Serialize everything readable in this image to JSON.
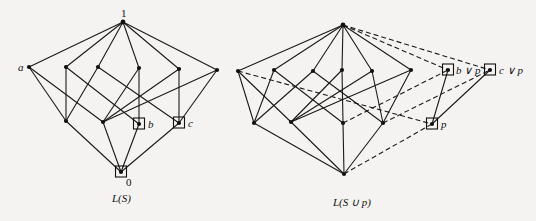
{
  "figure": {
    "left_diagram": {
      "caption": "L(S)",
      "nodes": [
        {
          "id": "top",
          "x": 123,
          "y": 22,
          "label": "1",
          "label_dx": -2,
          "label_dy": -5,
          "boxed": false
        },
        {
          "id": "a",
          "x": 29,
          "y": 67,
          "label": "a",
          "label_dx": -11,
          "label_dy": 4,
          "boxed": false
        },
        {
          "id": "m1",
          "x": 66,
          "y": 67,
          "label": "",
          "boxed": false
        },
        {
          "id": "m2",
          "x": 98,
          "y": 67,
          "label": "",
          "boxed": false
        },
        {
          "id": "m3",
          "x": 139,
          "y": 68,
          "label": "",
          "boxed": false
        },
        {
          "id": "m4",
          "x": 179,
          "y": 69,
          "label": "",
          "boxed": false
        },
        {
          "id": "m5",
          "x": 217,
          "y": 70,
          "label": "",
          "boxed": false
        },
        {
          "id": "l1",
          "x": 66,
          "y": 121,
          "label": "",
          "boxed": false
        },
        {
          "id": "l2",
          "x": 103,
          "y": 122,
          "label": "",
          "boxed": false
        },
        {
          "id": "b",
          "x": 139,
          "y": 124,
          "label": "b",
          "label_dx": 9,
          "label_dy": 4,
          "boxed": true
        },
        {
          "id": "c",
          "x": 179,
          "y": 123,
          "label": "c",
          "label_dx": 9,
          "label_dy": 4,
          "boxed": true
        },
        {
          "id": "bottom",
          "x": 121,
          "y": 172,
          "label": "0",
          "label_dx": 5,
          "label_dy": 14,
          "boxed": true
        }
      ],
      "edges": [
        [
          "top",
          "a",
          false
        ],
        [
          "top",
          "m1",
          false
        ],
        [
          "top",
          "m2",
          false
        ],
        [
          "top",
          "m3",
          false
        ],
        [
          "top",
          "m4",
          false
        ],
        [
          "top",
          "m5",
          false
        ],
        [
          "a",
          "l1",
          false
        ],
        [
          "a",
          "l2",
          false
        ],
        [
          "m1",
          "l1",
          false
        ],
        [
          "m1",
          "b",
          false
        ],
        [
          "m2",
          "l1",
          false
        ],
        [
          "m2",
          "c",
          false
        ],
        [
          "m3",
          "b",
          false
        ],
        [
          "m3",
          "l2",
          false
        ],
        [
          "m4",
          "c",
          false
        ],
        [
          "m4",
          "l2",
          false
        ],
        [
          "m5",
          "l2",
          false
        ],
        [
          "m5",
          "c",
          false
        ],
        [
          "l1",
          "bottom",
          false
        ],
        [
          "l2",
          "bottom",
          false
        ],
        [
          "b",
          "bottom",
          false
        ],
        [
          "c",
          "bottom",
          false
        ]
      ],
      "caption_x": 112,
      "caption_y": 202
    },
    "right_diagram": {
      "caption": "L(S ∪ p)",
      "nodes": [
        {
          "id": "top",
          "x": 343,
          "y": 25,
          "label": "",
          "boxed": false
        },
        {
          "id": "a",
          "x": 238,
          "y": 71,
          "label": "",
          "boxed": false
        },
        {
          "id": "m1",
          "x": 274,
          "y": 70,
          "label": "",
          "boxed": false
        },
        {
          "id": "m2",
          "x": 313,
          "y": 71,
          "label": "",
          "boxed": false
        },
        {
          "id": "m3",
          "x": 342,
          "y": 70,
          "label": "",
          "boxed": false
        },
        {
          "id": "m4",
          "x": 372,
          "y": 71,
          "label": "",
          "boxed": false
        },
        {
          "id": "m5",
          "x": 411,
          "y": 70,
          "label": "",
          "boxed": false
        },
        {
          "id": "l1",
          "x": 254,
          "y": 123,
          "label": "",
          "boxed": false
        },
        {
          "id": "l2",
          "x": 291,
          "y": 122,
          "label": "",
          "boxed": false
        },
        {
          "id": "b",
          "x": 343,
          "y": 123,
          "label": "",
          "boxed": false
        },
        {
          "id": "c",
          "x": 383,
          "y": 123,
          "label": "",
          "boxed": false
        },
        {
          "id": "bottom",
          "x": 344,
          "y": 174,
          "label": "",
          "boxed": false
        },
        {
          "id": "bvp",
          "x": 448,
          "y": 70,
          "label": "b ∨ p",
          "label_dx": 8,
          "label_dy": 4,
          "boxed": true
        },
        {
          "id": "cvp",
          "x": 490,
          "y": 70,
          "label": "c ∨ p",
          "label_dx": 9,
          "label_dy": 4,
          "boxed": true
        },
        {
          "id": "p",
          "x": 432,
          "y": 124,
          "label": "p",
          "label_dx": 9,
          "label_dy": 4,
          "boxed": true
        }
      ],
      "edges": [
        [
          "top",
          "a",
          false
        ],
        [
          "top",
          "m1",
          false
        ],
        [
          "top",
          "m2",
          false
        ],
        [
          "top",
          "m3",
          false
        ],
        [
          "top",
          "m4",
          false
        ],
        [
          "top",
          "m5",
          false
        ],
        [
          "a",
          "l1",
          false
        ],
        [
          "a",
          "l2",
          false
        ],
        [
          "m1",
          "l1",
          false
        ],
        [
          "m1",
          "b",
          false
        ],
        [
          "m2",
          "l1",
          false
        ],
        [
          "m2",
          "c",
          false
        ],
        [
          "m3",
          "b",
          false
        ],
        [
          "m3",
          "l2",
          false
        ],
        [
          "m4",
          "c",
          false
        ],
        [
          "m4",
          "l2",
          false
        ],
        [
          "m5",
          "l2",
          false
        ],
        [
          "m5",
          "c",
          false
        ],
        [
          "l1",
          "bottom",
          false
        ],
        [
          "l2",
          "bottom",
          false
        ],
        [
          "b",
          "bottom",
          false
        ],
        [
          "c",
          "bottom",
          false
        ],
        [
          "bvp",
          "p",
          false
        ],
        [
          "cvp",
          "p",
          false
        ],
        [
          "top",
          "bvp",
          true
        ],
        [
          "top",
          "cvp",
          true
        ],
        [
          "a",
          "p",
          true
        ],
        [
          "b",
          "bvp",
          true
        ],
        [
          "c",
          "cvp",
          true
        ],
        [
          "bottom",
          "p",
          true
        ]
      ],
      "caption_x": 333,
      "caption_y": 206
    }
  }
}
